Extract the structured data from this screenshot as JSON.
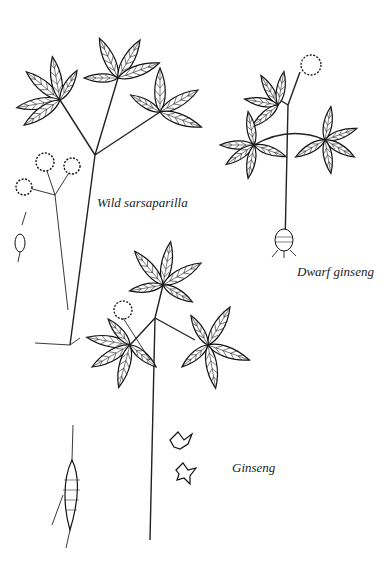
{
  "illustration": {
    "type": "botanical line drawing",
    "labels": {
      "wild_sarsaparilla": "Wild sarsaparilla",
      "dwarf_ginseng": "Dwarf ginseng",
      "ginseng": "Ginseng"
    },
    "colors": {
      "ink": "#111111",
      "background": "#ffffff"
    }
  }
}
